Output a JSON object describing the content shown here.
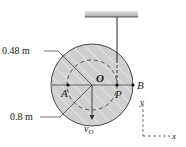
{
  "figure": {
    "type": "mechanics-diagram",
    "colors": {
      "disk_fill": "#cfcfcf",
      "hatch": "#ffffff",
      "ceiling": "#bdbdbd",
      "ink": "#222222"
    }
  },
  "labels": {
    "inner_radius": "0.48 m",
    "outer_radius": "0.8 m",
    "center": "O",
    "point_a": "A",
    "point_p": "P",
    "point_b": "B",
    "velocity_symbol": "v",
    "velocity_subscript": "O",
    "axis_y": "y",
    "axis_x": "x"
  }
}
